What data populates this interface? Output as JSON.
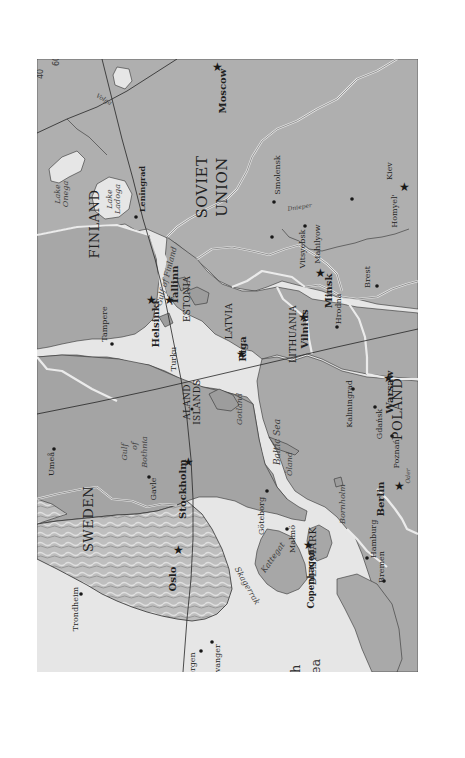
{
  "map": {
    "orientation": "rotated 90 degrees clockwise (north points left)",
    "colors": {
      "water": "#ececec",
      "land": "#a9a9a9",
      "land_soviet": "#b0b0b0",
      "norway_relief": "#c4c4c4",
      "border": "#f4f4f4",
      "coast": "#2b2b2b",
      "graticule": "#1e1e1e"
    },
    "graticule_labels": [
      "60",
      "40"
    ],
    "countries": {
      "finland": "FINLAND",
      "sweden": "SWEDEN",
      "soviet_union_1": "SOVIET",
      "soviet_union_2": "UNION",
      "estonia": "ESTONIA",
      "latvia": "LATVIA",
      "lithuania": "LITHUANIA",
      "poland": "POLAND",
      "denmark": "DENMARK",
      "aland_1": "ALAND",
      "aland_2": "ISLANDS"
    },
    "capitals": {
      "moscow": "Moscow",
      "helsinki": "Helsinki",
      "tallinn": "Tallinn",
      "riga": "Riga",
      "vilnius": "Vilnius",
      "minsk": "Minsk",
      "warsaw": "Warsaw",
      "stockholm": "Stockholm",
      "oslo": "Oslo",
      "copenhagen": "Copenhagen",
      "berlin": "Berlin",
      "kiev": "Kiev"
    },
    "cities": {
      "leningrad": "Leningrad",
      "smolensk": "Smolensk",
      "vitsyebsk": "Vitsyebsk",
      "mahilyow": "Mahilyow",
      "homyel": "Homyel'",
      "hrodna": "Hrodna",
      "brest": "Brest",
      "tampere": "Tampere",
      "turku": "Turku",
      "umea": "Umeå",
      "gavle": "Gavle",
      "goteborg": "Göteborg",
      "malmo": "Malmö",
      "kaliningrad": "Kaliningrad",
      "gdansk": "Gdańsk",
      "poznan": "Poznań",
      "hamburg": "Hamburg",
      "bremen": "Bremen",
      "trondheim": "Trondheim",
      "bergen": "Bergen",
      "stavanger": "Stavanger"
    },
    "water_labels": {
      "lake_onega_1": "Lake",
      "lake_onega_2": "Onega",
      "lake_ladoga_1": "Lake",
      "lake_ladoga_2": "Ladoga",
      "gulf_finland": "Gulf of Finland",
      "gulf_bothnia_1": "Gulf",
      "gulf_bothnia_2": "of",
      "gulf_bothnia_3": "Bothnia",
      "baltic_sea": "Baltic Sea",
      "gotland": "Gotland",
      "oland": "Öland",
      "bornholm": "Bornholm",
      "kattegat": "Kattegat",
      "skagerrak": "Skagerrak",
      "north_sea_1": "North",
      "north_sea_2": "Sea",
      "dnieper": "Dnieper",
      "volga": "Volga",
      "oder": "Oder"
    }
  }
}
